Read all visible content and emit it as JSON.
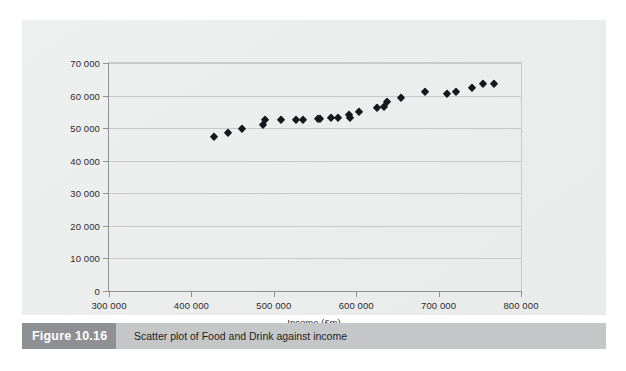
{
  "figure": {
    "number_label": "Figure 10.16",
    "caption": "Scatter plot of Food and Drink against income",
    "number_box_color": "#8e9093",
    "caption_strip_color": "#c4c6c7",
    "panel_background": "#ecedee"
  },
  "chart_data": {
    "type": "scatter",
    "title": "",
    "xlabel": "Income (£m)",
    "ylabel": "Food and Drink (£m)",
    "xlim": [
      300000,
      800000
    ],
    "ylim": [
      0,
      70000
    ],
    "xticks": [
      300000,
      400000,
      500000,
      600000,
      700000,
      800000
    ],
    "yticks": [
      0,
      10000,
      20000,
      30000,
      40000,
      50000,
      60000,
      70000
    ],
    "xtick_labels": [
      "300 000",
      "400 000",
      "500 000",
      "600 000",
      "700 000",
      "800 000"
    ],
    "ytick_labels": [
      "0",
      "10 000",
      "20 000",
      "30 000",
      "40 000",
      "50 000",
      "60 000",
      "70 000"
    ],
    "grid": "horizontal",
    "legend": null,
    "marker": "diamond",
    "marker_color": "#15181a",
    "points": [
      {
        "x": 428000,
        "y": 47400
      },
      {
        "x": 445000,
        "y": 48400
      },
      {
        "x": 461000,
        "y": 49700
      },
      {
        "x": 487000,
        "y": 51100
      },
      {
        "x": 489000,
        "y": 52500
      },
      {
        "x": 509000,
        "y": 52600
      },
      {
        "x": 527000,
        "y": 52600
      },
      {
        "x": 536000,
        "y": 52600
      },
      {
        "x": 554000,
        "y": 52900
      },
      {
        "x": 556000,
        "y": 52800
      },
      {
        "x": 570000,
        "y": 53000
      },
      {
        "x": 578000,
        "y": 53100
      },
      {
        "x": 592000,
        "y": 53200
      },
      {
        "x": 591000,
        "y": 54100
      },
      {
        "x": 604000,
        "y": 54900
      },
      {
        "x": 625000,
        "y": 56200
      },
      {
        "x": 634000,
        "y": 56400
      },
      {
        "x": 637000,
        "y": 58100
      },
      {
        "x": 654000,
        "y": 59200
      },
      {
        "x": 683000,
        "y": 61200
      },
      {
        "x": 710000,
        "y": 60600
      },
      {
        "x": 721000,
        "y": 61200
      },
      {
        "x": 740000,
        "y": 62200
      },
      {
        "x": 754000,
        "y": 63400
      },
      {
        "x": 767000,
        "y": 63700
      }
    ]
  }
}
